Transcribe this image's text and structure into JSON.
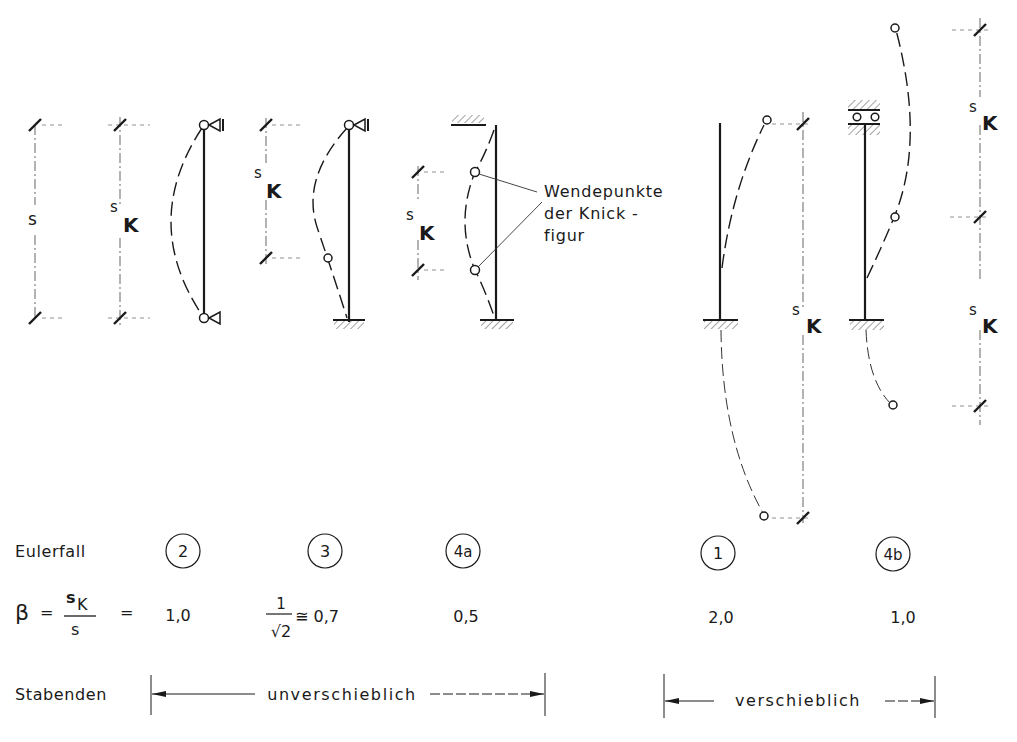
{
  "diagram": {
    "dimension_labels": {
      "s": "s",
      "sk_s": "s",
      "sk_K": "K"
    },
    "annotation": {
      "line1": "Wendepunkte",
      "line2": "der Knick  -",
      "line3": "figur"
    },
    "rows": {
      "eulerfall_label": "Eulerfall",
      "beta_label": "β",
      "beta_eq": "=",
      "beta_num_s": "s",
      "beta_num_K": "K",
      "beta_den": "s",
      "beta_eq2": "=",
      "stabenden_label": "Stabenden"
    },
    "cases": [
      {
        "id": "2",
        "beta": "1,0"
      },
      {
        "id": "3",
        "beta_frac_num": "1",
        "beta_frac_den": "√2",
        "beta_approx": "≅ 0,7"
      },
      {
        "id": "4a",
        "beta": "0,5"
      },
      {
        "id": "1",
        "beta": "2,0"
      },
      {
        "id": "4b",
        "beta": "1,0"
      }
    ],
    "groups": [
      {
        "label": "unverschieblich"
      },
      {
        "label": "verschieblich"
      }
    ]
  }
}
